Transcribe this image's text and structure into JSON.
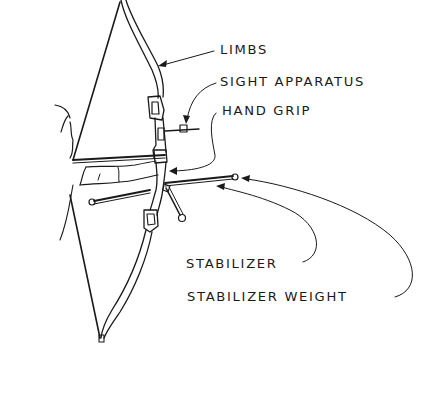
{
  "diagram": {
    "labels": [
      {
        "id": "limbs",
        "text": "LIMBS"
      },
      {
        "id": "sight-apparatus",
        "text": "SIGHT APPARATUS"
      },
      {
        "id": "hand-grip",
        "text": "HAND GRIP"
      },
      {
        "id": "stabilizer",
        "text": "STABILIZER"
      },
      {
        "id": "stabilizer-weight",
        "text": "STABILIZER WEIGHT"
      }
    ],
    "colors": {
      "ink": "#1a1a1a",
      "background": "#ffffff"
    }
  }
}
